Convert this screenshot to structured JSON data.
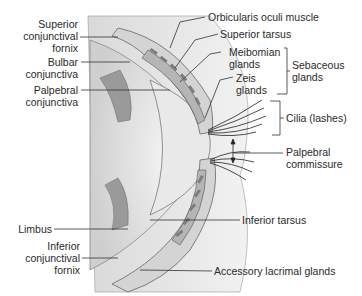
{
  "figure": {
    "labels_left": [
      {
        "id": "superior-conjunctival-fornix",
        "lines": [
          "Superior",
          "conjunctival",
          "fornix"
        ]
      },
      {
        "id": "bulbar-conjunctiva",
        "lines": [
          "Bulbar",
          "conjunctiva"
        ]
      },
      {
        "id": "palpebral-conjunctiva",
        "lines": [
          "Palpebral",
          "conjunctiva"
        ]
      },
      {
        "id": "limbus",
        "lines": [
          "Limbus"
        ]
      },
      {
        "id": "inferior-conjunctival-fornix",
        "lines": [
          "Inferior",
          "conjunctival",
          "fornix"
        ]
      }
    ],
    "labels_right": [
      {
        "id": "orbicularis-oculi-muscle",
        "lines": [
          "Orbicularis oculi muscle"
        ]
      },
      {
        "id": "superior-tarsus",
        "lines": [
          "Superior tarsus"
        ]
      },
      {
        "id": "meibomian-glands",
        "lines": [
          "Meibomian",
          "glands"
        ]
      },
      {
        "id": "zeis-glands",
        "lines": [
          "Zeis",
          "glands"
        ]
      },
      {
        "id": "sebaceous-glands",
        "lines": [
          "Sebaceous",
          "glands"
        ]
      },
      {
        "id": "cilia",
        "lines": [
          "Cilia (lashes)"
        ]
      },
      {
        "id": "palpebral-commissure",
        "lines": [
          "Palpebral",
          "commissure"
        ]
      },
      {
        "id": "inferior-tarsus",
        "lines": [
          "Inferior tarsus"
        ]
      },
      {
        "id": "accessory-lacrimal-glands",
        "lines": [
          "Accessory lacrimal glands"
        ]
      }
    ],
    "colors": {
      "background": "#ffffff",
      "tissue_light": "#e6e6e6",
      "tissue_mid": "#bdbdbd",
      "tissue_dark": "#8c8c8c",
      "line": "#333333"
    }
  }
}
